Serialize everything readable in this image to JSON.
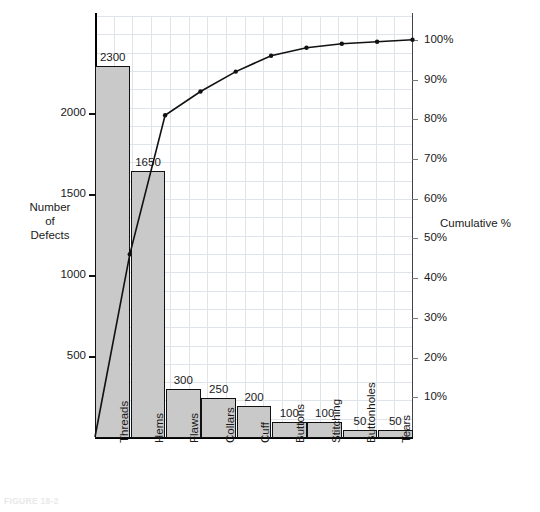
{
  "figure": {
    "caption": "FIGURE 18-2",
    "y_axis_title": "Number\nof\nDefects",
    "y2_axis_title": "Cumulative %"
  },
  "chart_data": {
    "type": "bar",
    "title": "",
    "subtitle": "",
    "xlabel": "",
    "ylabel": "Number of Defects",
    "y2label": "Cumulative %",
    "categories": [
      "Threads",
      "Hems",
      "Flaws",
      "Collars",
      "Cuff",
      "Buttons",
      "Stitching",
      "Buttonholes",
      "Tears"
    ],
    "values": [
      2300,
      1650,
      300,
      250,
      200,
      100,
      100,
      50,
      50
    ],
    "bar_labels": [
      "2300",
      "1650",
      "300",
      "250",
      "200",
      "100",
      "100",
      "50",
      "50"
    ],
    "total": 4900,
    "cumulative_values": [
      2300,
      3950,
      4250,
      4500,
      4700,
      4800,
      4900,
      4950,
      5000
    ],
    "cumulative_percent": [
      46,
      81,
      87,
      92,
      96,
      98,
      99,
      99.5,
      100
    ],
    "cumulative_percent_labels": [
      "46%",
      "81%",
      "87%",
      "92%",
      "96%",
      "98%",
      "99%",
      "99.5%",
      "100%"
    ],
    "ylim": [
      0,
      2600
    ],
    "yticks": [
      500,
      1000,
      1500,
      2000
    ],
    "ytick_labels": [
      "500",
      "1000",
      "1500",
      "2000"
    ],
    "y2lim": [
      0,
      106
    ],
    "y2ticks": [
      10,
      20,
      30,
      40,
      50,
      60,
      70,
      80,
      90,
      100
    ],
    "y2tick_labels": [
      "10%",
      "20%",
      "30%",
      "40%",
      "50%",
      "60%",
      "70%",
      "80%",
      "90%",
      "100%"
    ],
    "grid": true,
    "grid_color": "#dfe4ea",
    "bar_fill": "#c9c9c9",
    "bar_stroke": "#111111",
    "line_color": "#111111",
    "marker": "dot",
    "legend": "none"
  }
}
